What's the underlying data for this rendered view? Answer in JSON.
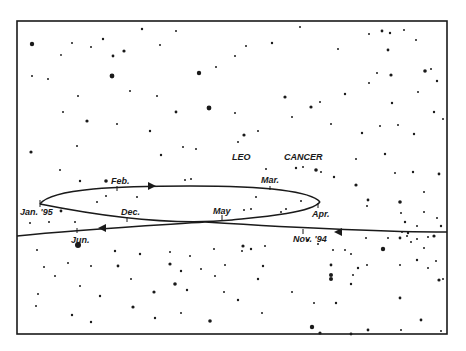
{
  "diagram": {
    "constellations": [
      {
        "label": "LEO",
        "x": 232,
        "y": 157
      },
      {
        "label": "CANCER",
        "x": 284,
        "y": 157
      }
    ],
    "path_labels": [
      {
        "id": "feb",
        "label": "Feb.",
        "x": 110,
        "y": 183
      },
      {
        "id": "mar",
        "label": "Mar.",
        "x": 261,
        "y": 183
      },
      {
        "id": "jan95",
        "label": "Jan. '95",
        "x": 19,
        "y": 214
      },
      {
        "id": "dec",
        "label": "Dec.",
        "x": 121,
        "y": 214
      },
      {
        "id": "may",
        "label": "May",
        "x": 213,
        "y": 214
      },
      {
        "id": "apr",
        "label": "Apr.",
        "x": 312,
        "y": 216
      },
      {
        "id": "nov94",
        "label": "Nov. '94",
        "x": 293,
        "y": 240
      },
      {
        "id": "jun",
        "label": "Jun.",
        "x": 71,
        "y": 242
      }
    ],
    "colors": {
      "ink": "#1a1a1a",
      "background": "#ffffff"
    }
  }
}
